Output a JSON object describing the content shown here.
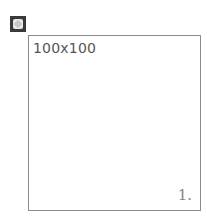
{
  "placeholder": {
    "icon": "broken-image-icon",
    "size_label": "100x100",
    "corner_label": "1."
  },
  "colors": {
    "border": "#8c8c8c",
    "text": "#555555",
    "icon": "#3a3a3a"
  }
}
